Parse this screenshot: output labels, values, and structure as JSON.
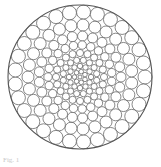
{
  "figure": {
    "outer_circle": {
      "cx": 80,
      "cy": 77,
      "r": 72
    },
    "stroke_color": "#555555",
    "background": "#ffffff",
    "rings": [
      {
        "radius": 65,
        "count": 29,
        "circle_r": 7.0
      },
      {
        "radius": 52,
        "count": 27,
        "circle_r": 6.0
      },
      {
        "radius": 41,
        "count": 25,
        "circle_r": 5.0
      },
      {
        "radius": 32,
        "count": 23,
        "circle_r": 4.2
      },
      {
        "radius": 24,
        "count": 20,
        "circle_r": 3.6
      },
      {
        "radius": 17,
        "count": 16,
        "circle_r": 3.1
      },
      {
        "radius": 11,
        "count": 12,
        "circle_r": 2.7
      },
      {
        "radius": 5.5,
        "count": 7,
        "circle_r": 2.3
      },
      {
        "radius": 0,
        "count": 1,
        "circle_r": 2.0
      }
    ]
  },
  "caption": {
    "text": "Fig. 1"
  }
}
